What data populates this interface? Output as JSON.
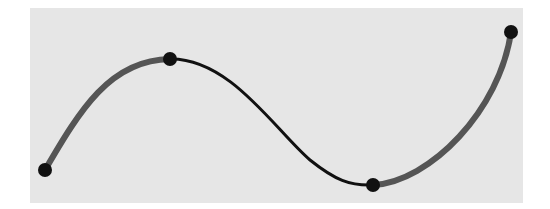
{
  "diagram": {
    "type": "piecewise-curve",
    "panel": {
      "x": 30,
      "y": 8,
      "width": 493,
      "height": 195,
      "fill": "#e6e6e6"
    },
    "anchor_points": [
      {
        "id": "p0",
        "x": 45,
        "y": 170
      },
      {
        "id": "p1",
        "x": 170,
        "y": 59
      },
      {
        "id": "p2",
        "x": 373,
        "y": 185
      },
      {
        "id": "p3",
        "x": 511,
        "y": 32
      }
    ],
    "segments": [
      {
        "id": "seg-left",
        "from": "p0",
        "to": "p1",
        "path": "M45,170 C80,110 110,60 170,59",
        "color": "#555555",
        "width": 6
      },
      {
        "id": "seg-middle",
        "from": "p1",
        "to": "p2",
        "path": "M170,59 C230,58 275,130 310,160 C335,180 350,186 373,185",
        "color": "#111111",
        "width": 3
      },
      {
        "id": "seg-right",
        "from": "p2",
        "to": "p3",
        "path": "M373,185 C430,182 500,110 511,32",
        "color": "#555555",
        "width": 6
      }
    ],
    "point_style": {
      "radius": 7,
      "fill": "#111111"
    }
  }
}
